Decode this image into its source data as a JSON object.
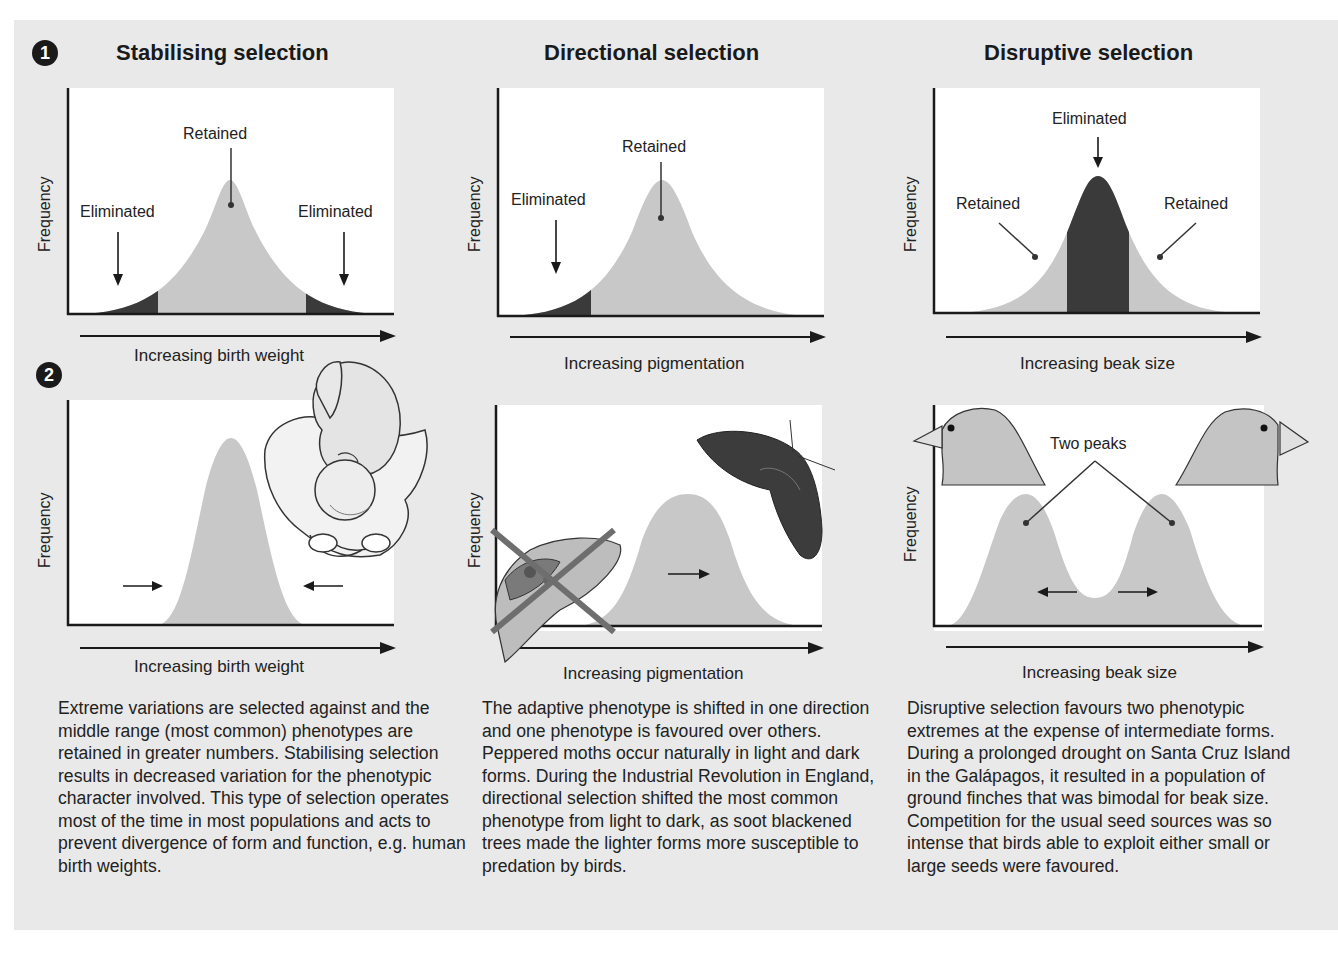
{
  "columns": [
    {
      "title": "Stabilising selection",
      "badge": "1",
      "top_chart": {
        "y_label": "Frequency",
        "x_label": "Increasing birth weight",
        "annotations": {
          "center": "Retained",
          "left": "Eliminated",
          "right": "Eliminated"
        }
      },
      "bottom_chart": {
        "badge": "2",
        "y_label": "Frequency",
        "x_label": "Increasing birth weight",
        "illustration": "baby-in-pelvis"
      },
      "description": "Extreme variations are selected against and the middle range (most common) phenotypes are retained in greater numbers. Stabilising selection results in decreased variation for the phenotypic character involved. This type of selection operates most of the time in most populations and acts to prevent divergence of form and function, e.g. human birth weights."
    },
    {
      "title": "Directional selection",
      "top_chart": {
        "y_label": "Frequency",
        "x_label": "Increasing pigmentation",
        "annotations": {
          "center": "Retained",
          "left": "Eliminated"
        }
      },
      "bottom_chart": {
        "y_label": "Frequency",
        "x_label": "Increasing pigmentation",
        "illustration": "light-moth-crossed-out and dark-moth"
      },
      "description": "The adaptive phenotype is shifted in one direction and one phenotype is favoured over others. Peppered moths occur naturally in light and dark forms. During the Industrial Revolution in England, directional selection shifted the most common phenotype from light to dark, as soot blackened trees made the lighter forms more susceptible to predation by birds."
    },
    {
      "title": "Disruptive selection",
      "top_chart": {
        "y_label": "Frequency",
        "x_label": "Increasing beak size",
        "annotations": {
          "center": "Eliminated",
          "left": "Retained",
          "right": "Retained"
        }
      },
      "bottom_chart": {
        "y_label": "Frequency",
        "x_label": "Increasing beak size",
        "annotations": {
          "center": "Two peaks"
        },
        "illustration": "small-beaked finch and large-beaked finch heads"
      },
      "description": "Disruptive selection favours two phenotypic extremes at the expense of intermediate forms. During a prolonged drought on Santa Cruz Island in the Galápagos, it resulted in a population of ground finches that was bimodal for beak size. Competition for the usual seed sources was so intense that birds able to exploit either small or large seeds were favoured."
    }
  ],
  "colors": {
    "background_panel": "#e9e9e9",
    "plot_bg": "#ffffff",
    "retained_fill": "#c8c8c8",
    "eliminated_fill": "#3a3a3a",
    "axis": "#1a1a1a",
    "cross": "#6e6e6e"
  }
}
